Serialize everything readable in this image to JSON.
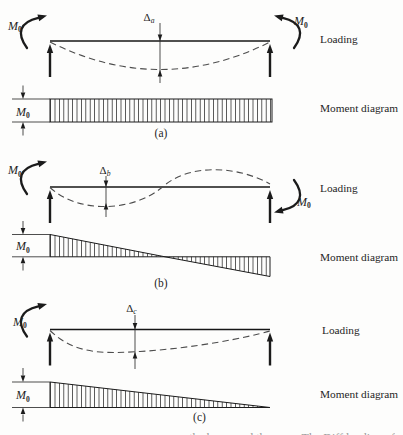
{
  "figure": {
    "panels": [
      {
        "id": "a",
        "caption": "(a)",
        "loading_label": "Loading",
        "moment_diagram_label": "Moment diagram",
        "left_end_moment": {
          "symbol": "M",
          "sub": "0",
          "direction": "clockwise"
        },
        "right_end_moment": {
          "symbol": "M",
          "sub": "0",
          "direction": "counterclockwise"
        },
        "midspan_deflection": {
          "symbol": "Δ",
          "sub": "a"
        },
        "moment_dimension": {
          "symbol": "M",
          "sub": "0"
        },
        "moment_diagram_shape": "constant-rectangle"
      },
      {
        "id": "b",
        "caption": "(b)",
        "loading_label": "Loading",
        "moment_diagram_label": "Moment diagram",
        "left_end_moment": {
          "symbol": "M",
          "sub": "0",
          "direction": "clockwise"
        },
        "right_end_moment": {
          "symbol": "M",
          "sub": "0",
          "direction": "clockwise"
        },
        "midspan_deflection": {
          "symbol": "Δ",
          "sub": "b"
        },
        "moment_dimension": {
          "symbol": "M",
          "sub": "0"
        },
        "moment_diagram_shape": "linear-antisymmetric-bowtie"
      },
      {
        "id": "c",
        "caption": "(c)",
        "loading_label": "Loading",
        "moment_diagram_label": "Moment diagram",
        "left_end_moment": {
          "symbol": "M",
          "sub": "0",
          "direction": "clockwise"
        },
        "midspan_deflection": {
          "symbol": "Δ",
          "sub": "c"
        },
        "moment_dimension": {
          "symbol": "M",
          "sub": "0"
        },
        "moment_diagram_shape": "triangle-max-at-left"
      }
    ],
    "bottom_cropped_text": "the beam and the span. The Diff loading of"
  }
}
